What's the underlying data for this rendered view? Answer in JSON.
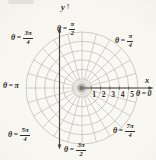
{
  "figure": {
    "axes": {
      "x_label": "x",
      "y_label": "y",
      "y_arrow": "↑"
    },
    "sym": {
      "theta": "θ",
      "eq": "="
    },
    "angle_labels": {
      "top": {
        "num": "π",
        "den": "2"
      },
      "upper_right": {
        "num": "π",
        "den": "4"
      },
      "upper_left": {
        "num": "3π",
        "den": "4"
      },
      "left": {
        "value": "π"
      },
      "right": {
        "value": "0"
      },
      "lower_left": {
        "num": "5π",
        "den": "4"
      },
      "bottom": {
        "num": "3π",
        "den": "2"
      },
      "lower_right": {
        "num": "7π",
        "den": "4"
      }
    },
    "radial_ticks": [
      "1",
      "2",
      "3",
      "4",
      "5"
    ],
    "grid": {
      "circles": 6,
      "spoke_step_deg": 15,
      "unit_px": 9.33
    },
    "colors": {
      "background": "#f9f8f4",
      "grid": "#bdb7ae",
      "axis": "#46433e",
      "text": "#2e2c29",
      "pole": "#6b6862"
    }
  }
}
